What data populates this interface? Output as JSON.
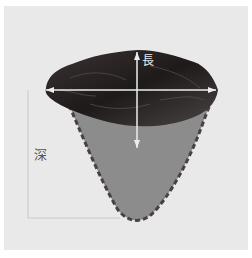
{
  "diagram": {
    "labels": {
      "length": "長",
      "depth": "深"
    },
    "colors": {
      "background": "#e9e9e9",
      "stone": "#2a2424",
      "depth_fill": "#8c8c8c",
      "dash_outline": "#4a4040",
      "measure_line": "#eeeeee",
      "guide_line": "#c8c8c8"
    }
  }
}
